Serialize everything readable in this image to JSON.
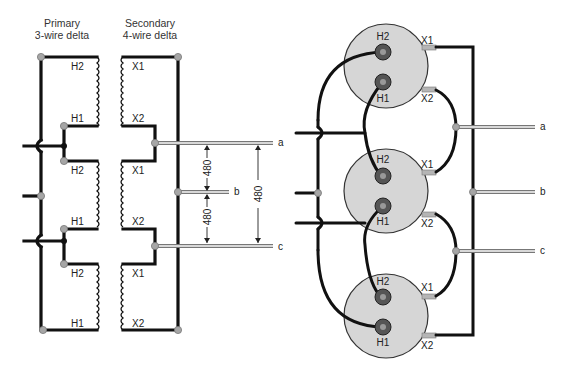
{
  "schematic": {
    "primary_title_line1": "Primary",
    "primary_title_line2": "3-wire delta",
    "secondary_title_line1": "Secondary",
    "secondary_title_line2": "4-wire delta",
    "primary_coils": [
      {
        "top": "H2",
        "bottom": "H1"
      },
      {
        "top": "H2",
        "bottom": "H1"
      },
      {
        "top": "H2",
        "bottom": "H1"
      }
    ],
    "secondary_coils": [
      {
        "top": "X1",
        "bottom": "X2"
      },
      {
        "top": "X1",
        "bottom": "X2"
      },
      {
        "top": "X1",
        "bottom": "X2"
      }
    ],
    "output_lines": [
      "a",
      "b",
      "c"
    ],
    "voltages": {
      "a_b": "480",
      "b_c": "480",
      "a_c": "480"
    }
  },
  "pictorial": {
    "transformers": [
      {
        "h_top": "H2",
        "h_bottom": "H1",
        "x_top": "X1",
        "x_bottom": "X2"
      },
      {
        "h_top": "H2",
        "h_bottom": "H1",
        "x_top": "X1",
        "x_bottom": "X2"
      },
      {
        "h_top": "H2",
        "h_bottom": "H1",
        "x_top": "X1",
        "x_bottom": "X2"
      }
    ],
    "output_lines": [
      "a",
      "b",
      "c"
    ]
  }
}
